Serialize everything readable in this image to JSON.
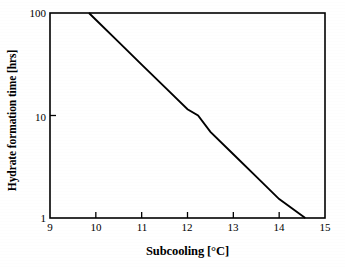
{
  "chart_data": {
    "type": "line",
    "title": "",
    "subtitle": "",
    "xlabel": "Subcooling [°C]",
    "ylabel": "Hydrate formation time [hrs]",
    "xlim": [
      9,
      15
    ],
    "ylim": [
      1,
      100
    ],
    "yscale": "log",
    "xscale": "linear",
    "grid": false,
    "legend": null,
    "xticks": [
      "9",
      "10",
      "11",
      "12",
      "13",
      "14",
      "15"
    ],
    "xtick_values": [
      9,
      10,
      11,
      12,
      13,
      14,
      15
    ],
    "yticks": [
      "1",
      "10",
      "100"
    ],
    "ytick_values": [
      1,
      10,
      100
    ],
    "series": [
      {
        "name": "Hydrate formation time",
        "color": "#000000",
        "x": [
          9.85,
          10.0,
          10.5,
          11.0,
          11.5,
          12.0,
          12.23,
          12.5,
          13.0,
          13.5,
          14.0,
          14.57
        ],
        "y": [
          100.0,
          86.0,
          52.0,
          31.4,
          19.0,
          11.5,
          10.0,
          6.93,
          4.19,
          2.53,
          1.53,
          1.0
        ],
        "annotations": []
      }
    ]
  },
  "axes": {
    "x_title": "Subcooling [°C]",
    "y_title": "Hydrate formation time [hrs]",
    "x_tick_labels": [
      "9",
      "10",
      "11",
      "12",
      "13",
      "14",
      "15"
    ],
    "y_tick_labels": [
      "100",
      "10",
      "1"
    ]
  },
  "colors": {
    "line": "#000000",
    "frame": "#000000",
    "background": "#ffffff",
    "text": "#000000"
  }
}
